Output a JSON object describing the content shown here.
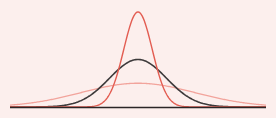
{
  "colors": {
    "background": "#fcefed",
    "narrow": "#e35d52",
    "standard": "#3d3a3b",
    "wide": "#f2a49c",
    "axis": "#2b2627"
  },
  "chart_data": {
    "type": "line",
    "title": "",
    "xlabel": "",
    "ylabel": "",
    "grid": false,
    "legend": "none",
    "mean": 0,
    "xlim": [
      -4.5,
      4.5
    ],
    "ylim": [
      0,
      0.85
    ],
    "series": [
      {
        "name": "narrow",
        "sigma": 0.5,
        "peak": 0.8,
        "color": "#e35d52"
      },
      {
        "name": "standard",
        "sigma": 1.0,
        "peak": 0.4,
        "color": "#3d3a3b"
      },
      {
        "name": "wide",
        "sigma": 2.0,
        "peak": 0.2,
        "color": "#f2a49c"
      }
    ]
  }
}
